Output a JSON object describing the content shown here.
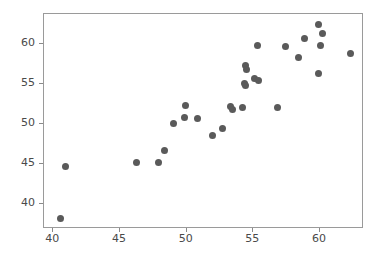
{
  "chart_data": {
    "type": "scatter",
    "title": "",
    "subtitle": "",
    "xlabel": "",
    "ylabel": "",
    "xlim": [
      39.3,
      63.3
    ],
    "ylim": [
      36.8,
      63.8
    ],
    "xticks": [
      40,
      45,
      50,
      55,
      60
    ],
    "yticks": [
      40,
      45,
      50,
      55,
      60
    ],
    "xtick_labels": [
      "40",
      "45",
      "50",
      "55",
      "60"
    ],
    "ytick_labels": [
      "40",
      "45",
      "50",
      "55",
      "60"
    ],
    "grid": false,
    "legend": null,
    "marker": {
      "shape": "circle",
      "color": "#5a5a5a",
      "size_px": 7,
      "edge_color": "#5a5a5a"
    },
    "frame_color": "#9a9a9a",
    "background_color": "#ffffff",
    "n_points": 37,
    "series": [
      {
        "name": "observations",
        "points": [
          {
            "x": 40.5,
            "y": 38.1
          },
          {
            "x": 40.9,
            "y": 44.7
          },
          {
            "x": 46.2,
            "y": 45.2
          },
          {
            "x": 47.9,
            "y": 45.1
          },
          {
            "x": 48.3,
            "y": 46.7
          },
          {
            "x": 49.0,
            "y": 50.0
          },
          {
            "x": 49.8,
            "y": 50.8
          },
          {
            "x": 49.9,
            "y": 52.3
          },
          {
            "x": 50.8,
            "y": 50.7
          },
          {
            "x": 51.9,
            "y": 48.6
          },
          {
            "x": 52.7,
            "y": 49.4
          },
          {
            "x": 53.3,
            "y": 52.2
          },
          {
            "x": 53.4,
            "y": 51.8
          },
          {
            "x": 54.2,
            "y": 52.1
          },
          {
            "x": 54.4,
            "y": 57.3
          },
          {
            "x": 54.5,
            "y": 56.8
          },
          {
            "x": 54.3,
            "y": 55.1
          },
          {
            "x": 54.4,
            "y": 54.8
          },
          {
            "x": 55.1,
            "y": 55.7
          },
          {
            "x": 55.4,
            "y": 55.5
          },
          {
            "x": 55.3,
            "y": 59.8
          },
          {
            "x": 56.8,
            "y": 52.0
          },
          {
            "x": 57.4,
            "y": 59.7
          },
          {
            "x": 58.4,
            "y": 58.3
          },
          {
            "x": 58.8,
            "y": 60.7
          },
          {
            "x": 59.9,
            "y": 62.5
          },
          {
            "x": 60.2,
            "y": 61.4
          },
          {
            "x": 60.0,
            "y": 59.8
          },
          {
            "x": 59.9,
            "y": 56.3
          },
          {
            "x": 62.3,
            "y": 58.9
          }
        ]
      }
    ]
  },
  "axes": {
    "x": {
      "ticks": [
        {
          "value": 40,
          "label": "40"
        },
        {
          "value": 45,
          "label": "45"
        },
        {
          "value": 50,
          "label": "50"
        },
        {
          "value": 55,
          "label": "55"
        },
        {
          "value": 60,
          "label": "60"
        }
      ]
    },
    "y": {
      "ticks": [
        {
          "value": 40,
          "label": "40"
        },
        {
          "value": 45,
          "label": "45"
        },
        {
          "value": 50,
          "label": "50"
        },
        {
          "value": 55,
          "label": "55"
        },
        {
          "value": 60,
          "label": "60"
        }
      ]
    }
  }
}
